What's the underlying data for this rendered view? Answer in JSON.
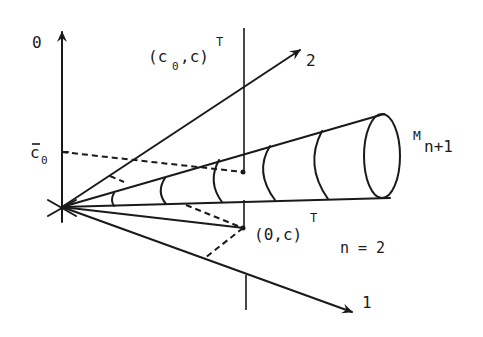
{
  "figure": {
    "labels": {
      "axis_0": "0",
      "axis_1": "1",
      "axis_2": "2",
      "point_upper": "(c",
      "point_upper_sub": "0",
      "point_upper_tail": ",c)",
      "point_upper_sup": "T",
      "point_lower": "(0,c)",
      "point_lower_sup": "T",
      "c0_bar": "c",
      "c0_bar_sub": "0",
      "cone_label": "M",
      "cone_label_sub": "n+1",
      "n_label": "n = 2"
    },
    "colors": {
      "ink": "#1a1a1a",
      "background": "#ffffff"
    }
  }
}
